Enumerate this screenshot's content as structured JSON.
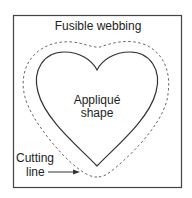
{
  "diagram": {
    "title": "Fusible webbing",
    "inner_label_line1": "Appliqué",
    "inner_label_line2": "shape",
    "cutting_label_line1": "Cutting",
    "cutting_label_line2": "line",
    "colors": {
      "stroke": "#333333",
      "dashed": "#666666",
      "background": "#ffffff"
    }
  }
}
